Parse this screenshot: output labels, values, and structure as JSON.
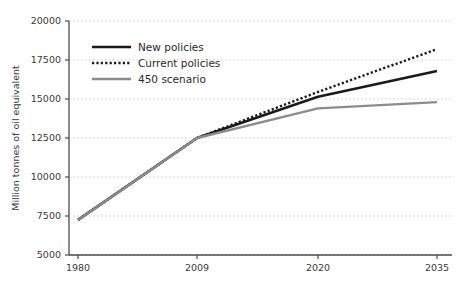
{
  "chart_data": {
    "type": "line",
    "title": "",
    "subtitle": "",
    "xlabel": "",
    "ylabel": "Million tonnes of oil equivalent",
    "categories": [
      "1980",
      "2009",
      "2020",
      "2035"
    ],
    "x_tick_labels": [
      "1980",
      "2009",
      "2020",
      "2035"
    ],
    "y_tick_labels": [
      "5000",
      "7500",
      "10000",
      "12500",
      "15000",
      "17500",
      "20000"
    ],
    "y_ticks": [
      5000,
      7500,
      10000,
      12500,
      15000,
      17500,
      20000
    ],
    "ylim": [
      5000,
      20000
    ],
    "grid": "horizontal-dotted",
    "legend_position": "upper-left-inside",
    "series": [
      {
        "name": "New policies",
        "style": "solid",
        "color": "#1a1a1a",
        "width": 2.6,
        "values": [
          7250,
          12500,
          15150,
          16800
        ]
      },
      {
        "name": "Current policies",
        "style": "dotted",
        "color": "#1a1a1a",
        "width": 2.4,
        "values": [
          7250,
          12500,
          15450,
          18200
        ]
      },
      {
        "name": "450 scenario",
        "style": "solid",
        "color": "#8c8c8c",
        "width": 2.4,
        "values": [
          7250,
          12500,
          14400,
          14800
        ]
      }
    ]
  },
  "legend": {
    "items": [
      {
        "label": "New policies"
      },
      {
        "label": "Current policies"
      },
      {
        "label": "450 scenario"
      }
    ]
  },
  "axes": {
    "y_title": "Million tonnes of oil equivalent"
  },
  "colors": {
    "axis": "#4d4d4d",
    "grid": "#c9c9c9",
    "text": "#3a3a3a",
    "series_dark": "#1a1a1a",
    "series_gray": "#8c8c8c",
    "background": "#ffffff"
  }
}
